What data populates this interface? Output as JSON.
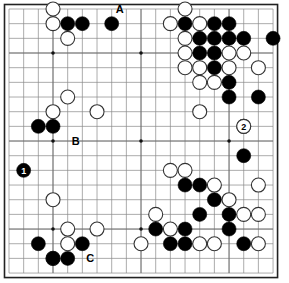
{
  "diagram": {
    "kind": "go-board-diagram",
    "board_size": 19,
    "title": "",
    "background_color": "#ffffff",
    "board_color": "#ffffff",
    "line_color": "#888888",
    "border_color": "#222222",
    "black_color": "#000000",
    "white_color": "#ffffff",
    "white_outline_color": "#333333",
    "geometry": {
      "origin_x": 9,
      "origin_y": 9,
      "spacing": 14.67,
      "stone_radius": 7.0,
      "hoshi_radius": 1.8
    },
    "hoshi": [
      {
        "col": 4,
        "row": 4
      },
      {
        "col": 10,
        "row": 4
      },
      {
        "col": 16,
        "row": 4
      },
      {
        "col": 4,
        "row": 10
      },
      {
        "col": 10,
        "row": 10
      },
      {
        "col": 16,
        "row": 10
      },
      {
        "col": 4,
        "row": 16
      },
      {
        "col": 10,
        "row": 16
      },
      {
        "col": 16,
        "row": 16
      }
    ],
    "black_stones": [
      {
        "col": 5,
        "row": 2
      },
      {
        "col": 6,
        "row": 2
      },
      {
        "col": 8,
        "row": 2
      },
      {
        "col": 13,
        "row": 2
      },
      {
        "col": 15,
        "row": 2
      },
      {
        "col": 16,
        "row": 2
      },
      {
        "col": 14,
        "row": 3
      },
      {
        "col": 15,
        "row": 3
      },
      {
        "col": 16,
        "row": 3
      },
      {
        "col": 17,
        "row": 3
      },
      {
        "col": 19,
        "row": 3
      },
      {
        "col": 14,
        "row": 4
      },
      {
        "col": 15,
        "row": 4
      },
      {
        "col": 15,
        "row": 5
      },
      {
        "col": 16,
        "row": 6
      },
      {
        "col": 16,
        "row": 7
      },
      {
        "col": 18,
        "row": 7
      },
      {
        "col": 3,
        "row": 9
      },
      {
        "col": 4,
        "row": 9
      },
      {
        "col": 17,
        "row": 11
      },
      {
        "col": 13,
        "row": 13
      },
      {
        "col": 14,
        "row": 13
      },
      {
        "col": 15,
        "row": 14
      },
      {
        "col": 14,
        "row": 15
      },
      {
        "col": 16,
        "row": 15
      },
      {
        "col": 11,
        "row": 16
      },
      {
        "col": 13,
        "row": 16
      },
      {
        "col": 16,
        "row": 16
      },
      {
        "col": 3,
        "row": 17
      },
      {
        "col": 6,
        "row": 17
      },
      {
        "col": 12,
        "row": 17
      },
      {
        "col": 13,
        "row": 17
      },
      {
        "col": 17,
        "row": 17
      },
      {
        "col": 4,
        "row": 18
      },
      {
        "col": 5,
        "row": 18
      }
    ],
    "white_stones": [
      {
        "col": 4,
        "row": 1
      },
      {
        "col": 13,
        "row": 1
      },
      {
        "col": 4,
        "row": 2
      },
      {
        "col": 12,
        "row": 2
      },
      {
        "col": 14,
        "row": 2
      },
      {
        "col": 5,
        "row": 3
      },
      {
        "col": 13,
        "row": 3
      },
      {
        "col": 13,
        "row": 4
      },
      {
        "col": 16,
        "row": 4
      },
      {
        "col": 17,
        "row": 4
      },
      {
        "col": 13,
        "row": 5
      },
      {
        "col": 14,
        "row": 5
      },
      {
        "col": 16,
        "row": 5
      },
      {
        "col": 18,
        "row": 5
      },
      {
        "col": 14,
        "row": 6
      },
      {
        "col": 15,
        "row": 6
      },
      {
        "col": 5,
        "row": 7
      },
      {
        "col": 4,
        "row": 8
      },
      {
        "col": 7,
        "row": 8
      },
      {
        "col": 14,
        "row": 8
      },
      {
        "col": 17,
        "row": 9
      },
      {
        "col": 12,
        "row": 12
      },
      {
        "col": 13,
        "row": 12
      },
      {
        "col": 15,
        "row": 13
      },
      {
        "col": 18,
        "row": 13
      },
      {
        "col": 16,
        "row": 14
      },
      {
        "col": 4,
        "row": 14
      },
      {
        "col": 11,
        "row": 15
      },
      {
        "col": 17,
        "row": 15
      },
      {
        "col": 18,
        "row": 15
      },
      {
        "col": 5,
        "row": 16
      },
      {
        "col": 7,
        "row": 16
      },
      {
        "col": 12,
        "row": 16
      },
      {
        "col": 10,
        "row": 17
      },
      {
        "col": 5,
        "row": 17
      },
      {
        "col": 14,
        "row": 17
      },
      {
        "col": 15,
        "row": 17
      },
      {
        "col": 18,
        "row": 17
      },
      {
        "col": 4,
        "row": 18
      }
    ],
    "numbered_stones": [
      {
        "label": "1",
        "color": "black",
        "col": 2,
        "row": 12
      },
      {
        "label": "2",
        "color": "white",
        "col": 17,
        "row": 9
      }
    ],
    "point_labels": [
      {
        "label": "A",
        "col": 8,
        "row": 1,
        "offset_x": 8,
        "offset_y": 0
      },
      {
        "label": "B",
        "col": 5,
        "row": 10,
        "offset_x": 8,
        "offset_y": 0
      },
      {
        "label": "C",
        "col": 6,
        "row": 18,
        "offset_x": 8,
        "offset_y": 0
      }
    ]
  }
}
